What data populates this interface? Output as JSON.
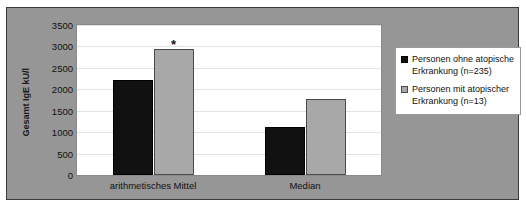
{
  "chart_data": {
    "type": "bar",
    "title": "",
    "xlabel": "",
    "ylabel": "Gesamt IgE kU/l",
    "ylim": [
      0,
      3500
    ],
    "ytick_step": 500,
    "yticks": [
      3500,
      3000,
      2500,
      2000,
      1500,
      1000,
      500,
      0
    ],
    "ytick_labels": [
      "3500",
      "3000",
      "2500",
      "2000",
      "1500",
      "1000",
      "500",
      "0"
    ],
    "grid": true,
    "legend_position": "right",
    "categories": [
      "arithmetisches Mittel",
      "Median"
    ],
    "series": [
      {
        "name": "Personen ohne atopische Erkrankung (n=235)",
        "color": "#111111",
        "values": [
          2220,
          1130
        ]
      },
      {
        "name": "Personen mit atopischer Erkrankung (n=13)",
        "color": "#a8a8a8",
        "values": [
          2930,
          1780
        ]
      }
    ],
    "annotations": [
      {
        "text": "*",
        "category": "arithmetisches Mittel",
        "series": "Personen mit atopischer Erkrankung (n=13)",
        "value": 3200
      }
    ]
  },
  "legend": {
    "entries": [
      {
        "label": "Personen ohne atopische Erkrankung (n=235)",
        "swatch": "dark"
      },
      {
        "label": "Personen mit atopischer Erkrankung (n=13)",
        "swatch": "light"
      }
    ]
  },
  "colors": {
    "chart_background": "#969696",
    "plot_background": "#ffffff",
    "series_dark": "#111111",
    "series_light": "#a8a8a8",
    "gridline": "#e2e2e2",
    "frame_border": "#3a3a3a"
  }
}
